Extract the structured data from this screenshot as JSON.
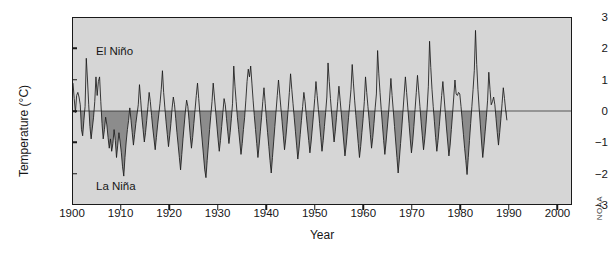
{
  "chart_data": {
    "type": "line",
    "title": "",
    "xlabel": "Year",
    "ylabel": "Temperature (°C)",
    "xlim": [
      1900,
      2003
    ],
    "ylim": [
      -3,
      3
    ],
    "xticks": [
      1900,
      1910,
      1920,
      1930,
      1940,
      1950,
      1960,
      1970,
      1980,
      1990,
      2000
    ],
    "yticks": [
      -3,
      -2,
      -1,
      0,
      1,
      2,
      3
    ],
    "grid": false,
    "legend": "none",
    "zero_line": 0,
    "fill_below_zero": true,
    "annotations": [
      {
        "text": "El Niño",
        "x": 1905,
        "y": 2.1
      },
      {
        "text": "La Niña",
        "x": 1905,
        "y": -2.3
      }
    ],
    "credit": "NOAA",
    "series": [
      {
        "name": "Oceanic Niño Index anomaly",
        "x_start": 1900,
        "x_step": 0.25,
        "values": [
          0.9,
          0.4,
          -0.05,
          0.5,
          0.6,
          0.45,
          0.2,
          -0.6,
          -0.8,
          -0.3,
          0.15,
          1.7,
          1.0,
          0.2,
          -0.5,
          -0.9,
          -0.55,
          -0.2,
          0.3,
          1.1,
          0.5,
          0.95,
          1.1,
          0.3,
          -0.4,
          -0.9,
          -0.6,
          -0.2,
          -0.45,
          -0.85,
          -1.2,
          -0.9,
          -1.3,
          -1.05,
          -0.6,
          -0.95,
          -1.5,
          -1.1,
          -0.7,
          -1.0,
          -1.35,
          -1.8,
          -2.1,
          -1.5,
          -1.0,
          -0.6,
          -0.3,
          0.1,
          -0.3,
          -0.7,
          -1.1,
          -0.75,
          -0.4,
          -0.1,
          0.2,
          0.85,
          0.35,
          -0.2,
          -0.6,
          -1.0,
          -0.7,
          -0.3,
          0.15,
          0.6,
          0.3,
          -0.15,
          -0.55,
          -0.9,
          -1.25,
          -0.85,
          -0.45,
          -0.1,
          0.25,
          0.7,
          1.3,
          0.6,
          0.1,
          -0.35,
          -0.75,
          -1.15,
          -0.8,
          -0.4,
          0.1,
          0.45,
          0.2,
          -0.25,
          -0.7,
          -1.1,
          -1.5,
          -1.9,
          -1.4,
          -0.9,
          -0.45,
          0.0,
          0.35,
          0.15,
          -0.3,
          -0.8,
          -1.2,
          -0.85,
          -0.4,
          0.05,
          0.5,
          0.9,
          0.4,
          -0.1,
          -0.55,
          -1.0,
          -1.45,
          -1.9,
          -2.15,
          -1.6,
          -1.1,
          -0.6,
          -0.15,
          0.3,
          0.9,
          0.45,
          0.0,
          -0.45,
          -0.9,
          -1.3,
          -0.95,
          -0.5,
          -0.05,
          0.4,
          0.2,
          -0.25,
          -0.65,
          -1.05,
          -0.7,
          -0.25,
          0.25,
          1.45,
          0.8,
          0.3,
          -0.2,
          -0.6,
          -1.0,
          -1.4,
          -1.05,
          -0.6,
          -0.2,
          0.35,
          0.95,
          1.35,
          1.1,
          1.45,
          0.9,
          0.35,
          -0.15,
          -0.6,
          -1.05,
          -1.5,
          -1.1,
          -0.65,
          -0.2,
          0.3,
          0.75,
          0.25,
          -0.25,
          -0.7,
          -1.15,
          -1.6,
          -2.0,
          -1.5,
          -1.0,
          -0.5,
          0.0,
          0.5,
          1.0,
          0.55,
          0.1,
          -0.35,
          -0.8,
          -1.25,
          -0.9,
          -0.45,
          0.05,
          0.6,
          1.2,
          0.7,
          0.25,
          -0.2,
          -0.65,
          -1.1,
          -1.55,
          -1.2,
          -0.75,
          -0.3,
          0.15,
          0.6,
          0.3,
          -0.15,
          -0.55,
          -0.95,
          -1.35,
          -1.0,
          -0.55,
          -0.1,
          0.4,
          0.95,
          0.5,
          0.05,
          -0.4,
          -0.85,
          -1.3,
          -0.95,
          -0.5,
          -0.05,
          0.45,
          1.55,
          0.95,
          0.4,
          -0.1,
          -0.55,
          -1.0,
          -0.65,
          -0.2,
          0.3,
          0.8,
          0.35,
          -0.1,
          -0.55,
          -1.0,
          -1.45,
          -1.1,
          -0.65,
          -0.2,
          0.25,
          0.7,
          1.5,
          0.9,
          0.35,
          -0.15,
          -0.6,
          -1.05,
          -1.5,
          -1.15,
          -0.7,
          -0.25,
          0.3,
          1.1,
          0.6,
          0.15,
          -0.3,
          -0.75,
          -1.2,
          -0.85,
          -0.4,
          0.1,
          0.55,
          1.95,
          1.2,
          0.6,
          0.05,
          -0.45,
          -0.95,
          -1.4,
          -1.0,
          -0.55,
          -0.1,
          0.45,
          1.05,
          0.5,
          0.0,
          -0.5,
          -1.0,
          -1.5,
          -2.0,
          -1.55,
          -1.05,
          -0.55,
          0.0,
          0.55,
          1.1,
          0.6,
          0.1,
          -0.4,
          -0.9,
          -1.35,
          -1.0,
          -0.5,
          0.05,
          0.6,
          1.15,
          0.65,
          0.15,
          -0.35,
          -0.8,
          -1.25,
          -0.9,
          -0.45,
          0.1,
          0.8,
          2.25,
          1.4,
          0.7,
          0.15,
          -0.35,
          -0.85,
          -1.3,
          -0.95,
          -0.5,
          0.0,
          0.5,
          0.95,
          0.45,
          -0.05,
          -0.55,
          -1.0,
          -1.45,
          -1.1,
          -0.6,
          -0.1,
          0.45,
          1.0,
          0.55,
          0.5,
          0.6,
          0.55,
          0.15,
          -0.3,
          -0.75,
          -1.2,
          -1.6,
          -2.05,
          -1.5,
          -0.95,
          -0.4,
          0.15,
          0.7,
          1.3,
          2.6,
          1.5,
          0.7,
          0.1,
          -0.45,
          -1.0,
          -1.5,
          -1.1,
          -0.65,
          -0.2,
          0.35,
          1.25,
          0.7,
          0.2,
          0.3,
          0.45,
          0.2,
          -0.25,
          -0.7,
          -1.1,
          -0.7,
          -0.25,
          0.25,
          0.75,
          0.4,
          0.0,
          -0.3
        ]
      }
    ]
  },
  "axes": {
    "y_title": "Temperature (°C)",
    "x_title": "Year",
    "y_tick_labels": [
      "3",
      "2",
      "1",
      "0",
      "−1",
      "−2",
      "−3"
    ],
    "x_tick_labels": [
      "1900",
      "1910",
      "1920",
      "1930",
      "1940",
      "1950",
      "1960",
      "1970",
      "1980",
      "1990",
      "2000"
    ]
  },
  "annotations": {
    "el_nino": "El Niño",
    "la_nina": "La Niña"
  },
  "credit": {
    "source": "NOAA"
  },
  "colors": {
    "plot_background": "#d6d6d6",
    "negative_fill": "#8c8c8c",
    "line": "#1a1a1a",
    "frame": "#1a1a1a",
    "text": "#161616"
  }
}
